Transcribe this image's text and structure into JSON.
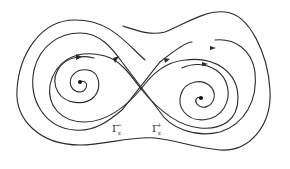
{
  "diagram": {
    "type": "phase-portrait",
    "colors": {
      "stroke": "#2a2a2a",
      "background": "#ffffff"
    },
    "labels": {
      "gamma_minus": {
        "base": "Γ",
        "sub": "ε",
        "sup": "−"
      },
      "gamma_plus": {
        "base": "Γ",
        "sub": "ε",
        "sup": "+"
      }
    },
    "equilibria": [
      {
        "name": "left-focus",
        "x": 80,
        "y": 82
      },
      {
        "name": "right-focus",
        "x": 201,
        "y": 98
      },
      {
        "name": "saddle",
        "x": 141,
        "y": 89
      }
    ]
  }
}
